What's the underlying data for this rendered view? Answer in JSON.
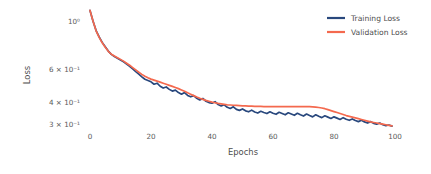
{
  "chart_data": {
    "type": "line",
    "title": "",
    "xlabel": "Epochs",
    "ylabel": "Loss",
    "xlim": [
      0,
      100
    ],
    "ylim": [
      0.28,
      1.22
    ],
    "yscale": "log",
    "xscale": "linear",
    "grid": false,
    "legend_position": "top-right",
    "xticks": [
      0,
      20,
      40,
      60,
      80,
      100
    ],
    "xticklabels": [
      "0",
      "20",
      "40",
      "60",
      "80",
      "100"
    ],
    "yticks": [
      1.0,
      0.6,
      0.4,
      0.3
    ],
    "yticklabels": [
      "10⁰",
      "6 × 10⁻¹",
      "4 × 10⁻¹",
      "3 × 10⁻¹"
    ],
    "x": [
      0,
      1,
      2,
      3,
      4,
      5,
      6,
      7,
      8,
      9,
      10,
      11,
      12,
      13,
      14,
      15,
      16,
      17,
      18,
      19,
      20,
      21,
      22,
      23,
      24,
      25,
      26,
      27,
      28,
      29,
      30,
      31,
      32,
      33,
      34,
      35,
      36,
      37,
      38,
      39,
      40,
      41,
      42,
      43,
      44,
      45,
      46,
      47,
      48,
      49,
      50,
      51,
      52,
      53,
      54,
      55,
      56,
      57,
      58,
      59,
      60,
      61,
      62,
      63,
      64,
      65,
      66,
      67,
      68,
      69,
      70,
      71,
      72,
      73,
      74,
      75,
      76,
      77,
      78,
      79,
      80,
      81,
      82,
      83,
      84,
      85,
      86,
      87,
      88,
      89,
      90,
      91,
      92,
      93,
      94,
      95,
      96,
      97,
      98,
      99
    ],
    "series": [
      {
        "name": "Training Loss",
        "color": "#29487d",
        "values": [
          1.145,
          1.01,
          0.905,
          0.84,
          0.788,
          0.748,
          0.712,
          0.685,
          0.668,
          0.655,
          0.641,
          0.628,
          0.612,
          0.596,
          0.578,
          0.56,
          0.544,
          0.527,
          0.512,
          0.505,
          0.497,
          0.483,
          0.489,
          0.472,
          0.462,
          0.468,
          0.455,
          0.446,
          0.451,
          0.438,
          0.43,
          0.438,
          0.424,
          0.417,
          0.423,
          0.41,
          0.402,
          0.409,
          0.396,
          0.39,
          0.387,
          0.394,
          0.381,
          0.375,
          0.38,
          0.369,
          0.364,
          0.371,
          0.36,
          0.356,
          0.362,
          0.354,
          0.35,
          0.357,
          0.349,
          0.345,
          0.352,
          0.347,
          0.343,
          0.35,
          0.344,
          0.34,
          0.348,
          0.343,
          0.338,
          0.346,
          0.341,
          0.336,
          0.344,
          0.338,
          0.333,
          0.341,
          0.335,
          0.33,
          0.338,
          0.332,
          0.327,
          0.334,
          0.329,
          0.324,
          0.33,
          0.325,
          0.32,
          0.327,
          0.321,
          0.317,
          0.322,
          0.316,
          0.312,
          0.317,
          0.311,
          0.307,
          0.312,
          0.306,
          0.303,
          0.307,
          0.301,
          0.298,
          0.3,
          0.296
        ]
      },
      {
        "name": "Validation Loss",
        "color": "#f4694e",
        "values": [
          1.145,
          1.008,
          0.902,
          0.836,
          0.784,
          0.744,
          0.71,
          0.686,
          0.672,
          0.659,
          0.646,
          0.633,
          0.618,
          0.603,
          0.587,
          0.571,
          0.556,
          0.542,
          0.53,
          0.521,
          0.513,
          0.507,
          0.501,
          0.495,
          0.489,
          0.483,
          0.477,
          0.471,
          0.465,
          0.459,
          0.452,
          0.445,
          0.437,
          0.43,
          0.423,
          0.416,
          0.41,
          0.405,
          0.4,
          0.396,
          0.392,
          0.389,
          0.386,
          0.384,
          0.382,
          0.38,
          0.379,
          0.378,
          0.377,
          0.376,
          0.375,
          0.375,
          0.374,
          0.374,
          0.373,
          0.373,
          0.373,
          0.372,
          0.372,
          0.372,
          0.372,
          0.372,
          0.372,
          0.372,
          0.372,
          0.372,
          0.372,
          0.372,
          0.372,
          0.372,
          0.372,
          0.372,
          0.372,
          0.371,
          0.37,
          0.368,
          0.366,
          0.363,
          0.359,
          0.355,
          0.351,
          0.347,
          0.343,
          0.339,
          0.335,
          0.332,
          0.329,
          0.326,
          0.323,
          0.32,
          0.317,
          0.314,
          0.311,
          0.309,
          0.307,
          0.305,
          0.303,
          0.301,
          0.299,
          0.297
        ]
      }
    ]
  },
  "legend": {
    "items": [
      {
        "label": "Training Loss",
        "color": "#29487d"
      },
      {
        "label": "Validation Loss",
        "color": "#f4694e"
      }
    ]
  },
  "axes": {
    "x_title": "Epochs",
    "y_title": "Loss"
  }
}
